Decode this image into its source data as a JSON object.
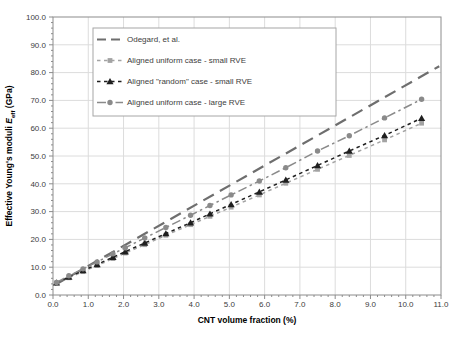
{
  "chart_data": {
    "type": "line",
    "title": "",
    "xlabel": "CNT volume fraction (%)",
    "ylabel": "Effective Young's moduli E_eff (GPa)",
    "ylabel_parts": {
      "prefix": "Effective Young's moduli ",
      "symbol": "E",
      "subscript": "eff",
      "suffix": " (GPa)"
    },
    "xlim": [
      0.0,
      11.0
    ],
    "ylim": [
      0.0,
      100.0
    ],
    "x_major_tick": 1.0,
    "x_minor_tick": 0.2,
    "y_major_tick": 10.0,
    "y_minor_tick": 2.0,
    "xtick_labels": [
      "0.0",
      "1.0",
      "2.0",
      "3.0",
      "4.0",
      "5.0",
      "6.0",
      "7.0",
      "8.0",
      "9.0",
      "10.0",
      "11.0"
    ],
    "ytick_labels": [
      "0.0",
      "10.0",
      "20.0",
      "30.0",
      "40.0",
      "50.0",
      "60.0",
      "70.0",
      "80.0",
      "90.0",
      "100.0"
    ],
    "grid": true,
    "legend_position": "top-left-inside",
    "colors": {
      "grid": "#dcdcdc",
      "axis": "#8c8c8c",
      "tick_text": "#3d3d3d",
      "legend_border": "#a6a6a6"
    },
    "series": [
      {
        "name": "Odegard, et al.",
        "marker": "none",
        "style": "long-dash",
        "color": "#6e6e6e",
        "linewidth": 2.2,
        "x": [
          0.05,
          10.95
        ],
        "y": [
          3.6,
          82.3
        ]
      },
      {
        "name": "Aligned uniform case - small RVE",
        "marker": "square",
        "style": "dash",
        "color": "#a3a3a3",
        "linewidth": 1.5,
        "x": [
          0.1,
          0.45,
          0.85,
          1.25,
          1.7,
          2.05,
          2.6,
          3.2,
          3.9,
          4.45,
          5.05,
          5.85,
          6.6,
          7.5,
          8.4,
          9.4,
          10.45
        ],
        "y": [
          4.3,
          6.2,
          8.4,
          10.6,
          13.1,
          15.1,
          18.1,
          21.5,
          25.3,
          28.3,
          31.6,
          36.0,
          40.2,
          45.2,
          50.2,
          55.8,
          61.8
        ]
      },
      {
        "name": "Aligned \"random\" case - small RVE",
        "marker": "triangle",
        "style": "dash",
        "color": "#1f1f1f",
        "linewidth": 1.5,
        "x": [
          0.1,
          0.45,
          0.85,
          1.25,
          1.7,
          2.05,
          2.6,
          3.2,
          3.9,
          4.45,
          5.05,
          5.85,
          6.6,
          7.5,
          8.4,
          9.4,
          10.45
        ],
        "y": [
          4.4,
          6.5,
          8.8,
          11.0,
          13.6,
          15.6,
          18.7,
          22.1,
          26.0,
          29.2,
          32.6,
          37.1,
          41.4,
          46.6,
          51.8,
          57.4,
          63.6
        ]
      },
      {
        "name": "Aligned uniform case - large RVE",
        "marker": "circle",
        "style": "dash-dot",
        "color": "#8a8a8a",
        "linewidth": 1.5,
        "x": [
          0.1,
          0.45,
          0.85,
          1.25,
          1.7,
          2.05,
          2.6,
          3.2,
          3.9,
          4.45,
          5.05,
          5.85,
          6.6,
          7.5,
          8.4,
          9.4,
          10.45
        ],
        "y": [
          4.5,
          6.9,
          9.4,
          11.9,
          14.8,
          17.0,
          20.5,
          24.3,
          28.7,
          32.2,
          36.0,
          41.0,
          45.8,
          51.8,
          57.3,
          63.7,
          70.4
        ]
      }
    ]
  }
}
